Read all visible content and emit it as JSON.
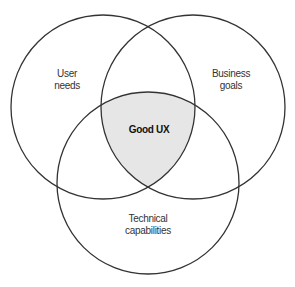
{
  "diagram": {
    "type": "venn",
    "caption": "... g ... ... ... ... ... p ...",
    "circles": [
      {
        "id": "user-needs",
        "label_lines": [
          "User",
          "needs"
        ],
        "cx": 103,
        "cy": 107,
        "r": 92
      },
      {
        "id": "business-goals",
        "label_lines": [
          "Business",
          "goals"
        ],
        "cx": 193,
        "cy": 107,
        "r": 92
      },
      {
        "id": "technical-capabilities",
        "label_lines": [
          "Technical",
          "capabilities"
        ],
        "cx": 148,
        "cy": 183,
        "r": 91
      }
    ],
    "intersection": {
      "label": "Good UX",
      "fill": "#e6e6e6"
    },
    "stroke_color": "#333333"
  }
}
